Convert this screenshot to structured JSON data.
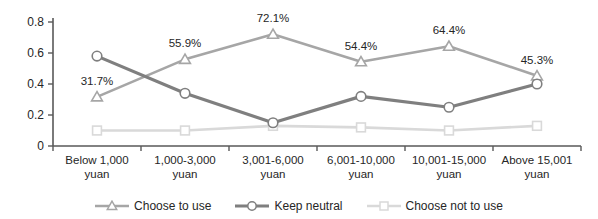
{
  "chart_data": {
    "type": "line",
    "title": "",
    "xlabel": "",
    "ylabel": "",
    "grid": false,
    "legend_position": "bottom",
    "categories": [
      "Below 1,000\nyuan",
      "1,000-3,000\nyuan",
      "3,001-6,000\nyuan",
      "6,001-10,000\nyuan",
      "10,001-15,000\nyuan",
      "Above 15,001\nyuan"
    ],
    "y_axis": {
      "min": 0,
      "max": 0.8,
      "step": 0.2,
      "tick_labels": [
        "0",
        "0.2",
        "0.4",
        "0.6",
        "0.8"
      ]
    },
    "series": [
      {
        "name": "Choose not to use",
        "marker": "square",
        "color": "#d9d9d9",
        "line_width": 2.6,
        "values": [
          0.1,
          0.1,
          0.13,
          0.12,
          0.1,
          0.13
        ],
        "data_labels": null
      },
      {
        "name": "Choose to use",
        "marker": "triangle",
        "color": "#a6a6a6",
        "line_width": 2.6,
        "values": [
          0.317,
          0.559,
          0.721,
          0.544,
          0.644,
          0.453
        ],
        "data_labels": [
          "31.7%",
          "55.9%",
          "72.1%",
          "54.4%",
          "64.4%",
          "45.3%"
        ]
      },
      {
        "name": "Keep neutral",
        "marker": "circle",
        "color": "#7f7f7f",
        "line_width": 3.2,
        "values": [
          0.58,
          0.34,
          0.15,
          0.32,
          0.25,
          0.4
        ],
        "data_labels": null
      }
    ],
    "legend_order": [
      "Choose to use",
      "Keep neutral",
      "Choose not to use"
    ]
  },
  "colors": {
    "background": "#ffffff",
    "axis": "#595959",
    "text": "#262626",
    "data_label": "#363636",
    "marker_fill": "#ffffff"
  }
}
